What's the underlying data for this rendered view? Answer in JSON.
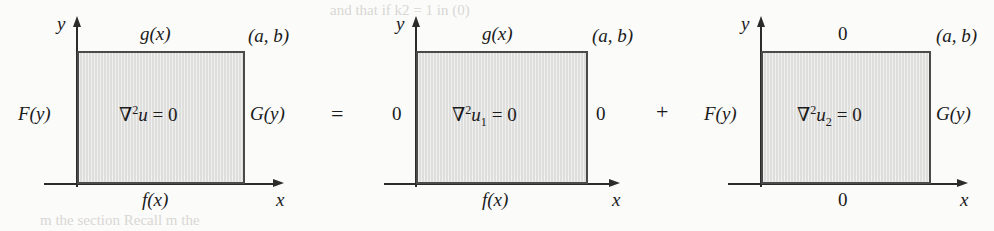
{
  "figure": {
    "operators": {
      "equals": "=",
      "plus": "+"
    },
    "bleed_text": {
      "top": "and  that  if  k2  = 1  in  (0)",
      "bottom": "m  the  section  Recall  m  the"
    },
    "colors": {
      "region_fill": "#dededd",
      "region_border": "#4a4a4a",
      "axis": "#2b2b2b",
      "background": "#fbfbfa",
      "text": "#1a1a1a"
    }
  },
  "panels": [
    {
      "id": "panel-original",
      "axis_y_label": "y",
      "axis_x_label": "x",
      "corner_label": "(a, b)",
      "top_label": "g(x)",
      "bottom_label": "f(x)",
      "left_label": "F(y)",
      "right_label": "G(y)",
      "equation": {
        "operator": "∇",
        "exponent": "2",
        "variable": "u",
        "subscript": "",
        "relation": "=",
        "value": "0",
        "full": "∇2u = 0"
      }
    },
    {
      "id": "panel-u1",
      "axis_y_label": "y",
      "axis_x_label": "x",
      "corner_label": "(a, b)",
      "top_label": "g(x)",
      "bottom_label": "f(x)",
      "left_label": "0",
      "right_label": "0",
      "equation": {
        "operator": "∇",
        "exponent": "2",
        "variable": "u",
        "subscript": "1",
        "relation": "=",
        "value": "0",
        "full": "∇2u1 = 0"
      }
    },
    {
      "id": "panel-u2",
      "axis_y_label": "y",
      "axis_x_label": "x",
      "corner_label": "(a, b)",
      "top_label": "0",
      "bottom_label": "0",
      "left_label": "F(y)",
      "right_label": "G(y)",
      "equation": {
        "operator": "∇",
        "exponent": "2",
        "variable": "u",
        "subscript": "2",
        "relation": "=",
        "value": "0",
        "full": "∇2u2 = 0"
      }
    }
  ]
}
